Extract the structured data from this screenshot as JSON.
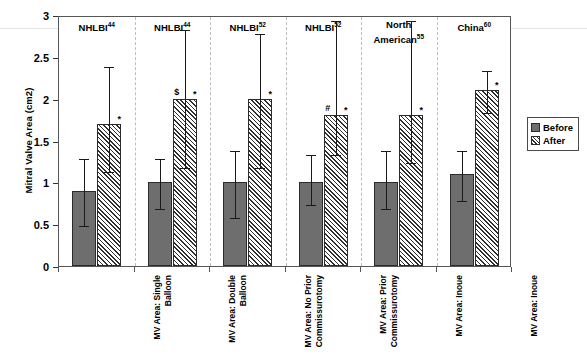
{
  "chart_data": {
    "type": "bar",
    "title": "",
    "xlabel": "",
    "ylabel": "Mitral Valve Area (cm2)",
    "ylim": [
      0,
      3
    ],
    "ytick_labels": [
      "0",
      "0.5",
      "1",
      "1.5",
      "2",
      "2.5",
      "3"
    ],
    "ytick_values": [
      0,
      0.5,
      1,
      1.5,
      2,
      2.5,
      3
    ],
    "grid": false,
    "legend_position": "right",
    "categories": [
      "MV Area: Single Balloon",
      "MV Area: Double Balloon",
      "MV Area: No Prior Commissurotomy",
      "MV Area: Prior Commissurotomy",
      "MV Area: Inoue",
      "MV Area: Inoue"
    ],
    "group_headers": [
      {
        "name": "NHLBI",
        "ref": "44"
      },
      {
        "name": "NHLBI",
        "ref": "44"
      },
      {
        "name": "NHLBI",
        "ref": "52"
      },
      {
        "name": "NHLBI",
        "ref": "52"
      },
      {
        "name": "North American",
        "ref": "55"
      },
      {
        "name": "China",
        "ref": "60"
      }
    ],
    "series": [
      {
        "name": "Before",
        "color": "#6e6e6e",
        "fill": "solid",
        "values": [
          0.9,
          1.0,
          1.0,
          1.0,
          1.0,
          1.1
        ],
        "err_low": [
          0.5,
          0.7,
          0.6,
          0.75,
          0.7,
          0.8
        ],
        "err_high": [
          1.3,
          1.3,
          1.4,
          1.35,
          1.4,
          1.4
        ]
      },
      {
        "name": "After",
        "color": "#2f2f2f",
        "fill": "diagonal-hatch",
        "values": [
          1.7,
          2.0,
          2.0,
          1.8,
          1.8,
          2.1
        ],
        "err_low": [
          1.15,
          1.2,
          1.2,
          1.35,
          1.25,
          1.85
        ],
        "err_high": [
          2.4,
          2.85,
          2.8,
          2.95,
          2.95,
          2.35
        ]
      }
    ],
    "annotations": [
      {
        "group": 1,
        "symbols": [
          "*"
        ]
      },
      {
        "group": 2,
        "symbols": [
          "$",
          "*"
        ]
      },
      {
        "group": 3,
        "symbols": [
          "*"
        ]
      },
      {
        "group": 4,
        "symbols": [
          "#",
          "*"
        ]
      },
      {
        "group": 5,
        "symbols": [
          "*"
        ]
      },
      {
        "group": 6,
        "symbols": [
          "*"
        ]
      }
    ]
  },
  "legend": {
    "items": [
      {
        "label": "Before",
        "swatch": "solid-grey-swatch"
      },
      {
        "label": "After",
        "swatch": "hatched-swatch"
      }
    ]
  },
  "axis": {
    "y_title": "Mitral Valve Area (cm2)"
  }
}
